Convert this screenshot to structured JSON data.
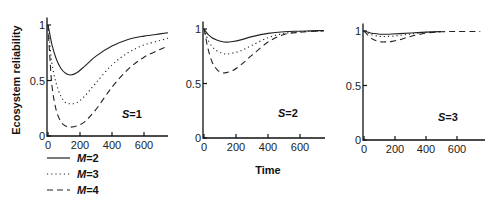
{
  "chart_data": [
    {
      "type": "line",
      "panel_label": {
        "italic": "S",
        "text": "=1"
      },
      "xlabel": "",
      "ylabel": "Ecosystem reliability",
      "xlim": [
        0,
        750
      ],
      "ylim": [
        0,
        1.05
      ],
      "xticks": [
        0,
        200,
        400,
        600
      ],
      "yticks": [
        0,
        0.5,
        1
      ],
      "ytick_labels": [
        "0",
        "0.5",
        "1"
      ],
      "x": [
        0,
        10,
        25,
        50,
        80,
        110,
        140,
        180,
        230,
        300,
        400,
        500,
        600,
        700,
        750
      ],
      "series": [
        {
          "name": "M=2",
          "style": "solid",
          "values": [
            1.0,
            0.93,
            0.82,
            0.7,
            0.61,
            0.565,
            0.55,
            0.57,
            0.63,
            0.72,
            0.81,
            0.87,
            0.9,
            0.92,
            0.93
          ]
        },
        {
          "name": "M=3",
          "style": "dotted",
          "values": [
            1.0,
            0.85,
            0.65,
            0.48,
            0.36,
            0.3,
            0.29,
            0.3,
            0.36,
            0.48,
            0.64,
            0.75,
            0.82,
            0.86,
            0.88
          ]
        },
        {
          "name": "M=4",
          "style": "dashed",
          "values": [
            1.0,
            0.75,
            0.45,
            0.24,
            0.13,
            0.09,
            0.08,
            0.09,
            0.13,
            0.24,
            0.44,
            0.6,
            0.71,
            0.78,
            0.81
          ]
        }
      ]
    },
    {
      "type": "line",
      "panel_label": {
        "italic": "S",
        "text": "=2"
      },
      "xlabel": "Time",
      "ylabel": "",
      "xlim": [
        0,
        750
      ],
      "ylim": [
        0,
        1.05
      ],
      "xticks": [
        0,
        200,
        400,
        600
      ],
      "yticks": [
        0,
        0.5,
        1
      ],
      "ytick_labels": [
        "0",
        "0.5",
        "1"
      ],
      "x": [
        0,
        10,
        25,
        50,
        80,
        110,
        140,
        180,
        230,
        300,
        400,
        500,
        600,
        700,
        750
      ],
      "series": [
        {
          "name": "M=2",
          "style": "solid",
          "values": [
            1.0,
            0.98,
            0.95,
            0.92,
            0.9,
            0.885,
            0.88,
            0.885,
            0.9,
            0.93,
            0.96,
            0.975,
            0.98,
            0.985,
            0.985
          ]
        },
        {
          "name": "M=3",
          "style": "dotted",
          "values": [
            1.0,
            0.96,
            0.9,
            0.84,
            0.8,
            0.78,
            0.77,
            0.78,
            0.8,
            0.85,
            0.92,
            0.96,
            0.975,
            0.98,
            0.985
          ]
        },
        {
          "name": "M=4",
          "style": "dashed",
          "values": [
            1.0,
            0.93,
            0.82,
            0.7,
            0.63,
            0.6,
            0.6,
            0.62,
            0.67,
            0.76,
            0.88,
            0.95,
            0.97,
            0.98,
            0.985
          ]
        }
      ]
    },
    {
      "type": "line",
      "panel_label": {
        "italic": "S",
        "text": "=3"
      },
      "xlabel": "",
      "ylabel": "",
      "xlim": [
        0,
        750
      ],
      "ylim": [
        0,
        1.05
      ],
      "xticks": [
        0,
        200,
        400,
        600
      ],
      "yticks": [
        0,
        0.5,
        1
      ],
      "ytick_labels": [
        "0",
        "0.5",
        "1"
      ],
      "x": [
        0,
        10,
        25,
        50,
        80,
        110,
        140,
        180,
        230,
        300,
        400,
        500,
        600,
        700,
        750
      ],
      "series": [
        {
          "name": "M=2",
          "style": "solid",
          "values": [
            1.0,
            0.995,
            0.99,
            0.98,
            0.975,
            0.97,
            0.97,
            0.972,
            0.976,
            0.982,
            0.99,
            0.995,
            null,
            null,
            null
          ]
        },
        {
          "name": "M=3",
          "style": "dotted",
          "values": [
            1.0,
            0.99,
            0.98,
            0.965,
            0.955,
            0.95,
            0.95,
            0.952,
            0.96,
            0.972,
            0.988,
            0.995,
            null,
            null,
            null
          ]
        },
        {
          "name": "M=4",
          "style": "dashed",
          "values": [
            1.0,
            0.985,
            0.96,
            0.93,
            0.91,
            0.9,
            0.9,
            0.905,
            0.92,
            0.95,
            0.98,
            0.993,
            0.995,
            0.995,
            0.995
          ]
        }
      ]
    }
  ],
  "legend": {
    "entries": [
      {
        "prefix": "M",
        "text": "=2",
        "style": "solid"
      },
      {
        "prefix": "M",
        "text": "=3",
        "style": "dotted"
      },
      {
        "prefix": "M",
        "text": "=4",
        "style": "dashed"
      }
    ]
  },
  "labels": {
    "ylabel": "Ecosystem reliability",
    "xlabel": "Time"
  }
}
